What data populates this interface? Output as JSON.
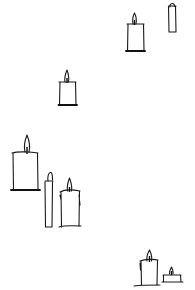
{
  "scene": {
    "title": "",
    "description": "Hand-drawn line sketches of candles scattered on a white background",
    "background": "#ffffff",
    "ink_color": "#1a1a1a",
    "candles": [
      {
        "id": "candle-1",
        "type": "pillar",
        "x": 127,
        "y": 24,
        "w": 17,
        "h": 27,
        "lit": true
      },
      {
        "id": "candle-2",
        "type": "taper",
        "x": 168,
        "y": 6,
        "w": 8,
        "h": 26,
        "lit": false
      },
      {
        "id": "candle-3",
        "type": "pillar",
        "x": 59,
        "y": 82,
        "w": 17,
        "h": 23,
        "lit": true
      },
      {
        "id": "candle-4",
        "type": "pillar-large",
        "x": 12,
        "y": 152,
        "w": 26,
        "h": 38,
        "lit": true
      },
      {
        "id": "candle-5",
        "type": "taper",
        "x": 45,
        "y": 181,
        "w": 8,
        "h": 46,
        "lit": false
      },
      {
        "id": "candle-6",
        "type": "pillar-melted",
        "x": 60,
        "y": 190,
        "w": 20,
        "h": 37,
        "lit": true
      },
      {
        "id": "candle-7",
        "type": "pillar",
        "x": 140,
        "y": 259,
        "w": 18,
        "h": 27,
        "lit": true
      },
      {
        "id": "candle-8",
        "type": "tealight",
        "x": 163,
        "y": 273,
        "w": 19,
        "h": 9,
        "lit": true
      }
    ]
  }
}
